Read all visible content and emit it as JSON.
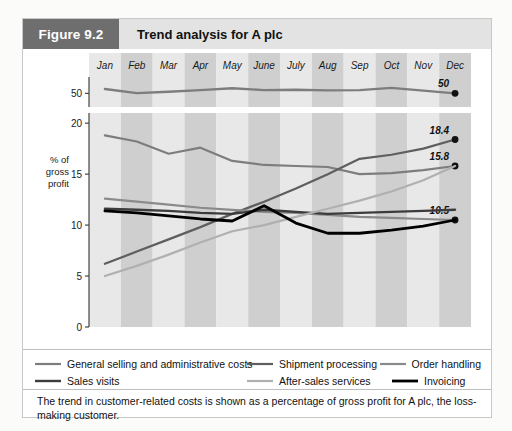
{
  "header": {
    "figure_number": "Figure 9.2",
    "title": "Trend analysis for A plc",
    "badge_color": "#6e6e6e",
    "bar_color": "#e3e3e3"
  },
  "caption": {
    "line1": "The trend in customer-related costs is shown as a percentage of gross profit for A plc,",
    "line2": "the loss-making customer."
  },
  "legend": {
    "items": [
      {
        "label": "General selling and administrative costs",
        "color": "#7d7d7d",
        "width": 2.2
      },
      {
        "label": "Shipment processing",
        "color": "#5e5e5e",
        "width": 2.2
      },
      {
        "label": "Order handling",
        "color": "#8a8a8a",
        "width": 2.2
      },
      {
        "label": "Sales visits",
        "color": "#3c3c3c",
        "width": 2.4
      },
      {
        "label": "After-sales services",
        "color": "#b0b0b0",
        "width": 2.2
      },
      {
        "label": "Invoicing",
        "color": "#000000",
        "width": 2.8
      }
    ]
  },
  "chart_data": {
    "type": "line",
    "title": "Trend analysis for A plc",
    "xlabel": "",
    "ylabel": "% of gross profit",
    "ylabel_lines": [
      "% of",
      "gross",
      "profit"
    ],
    "categories": [
      "Jan",
      "Feb",
      "Mar",
      "Apr",
      "May",
      "June",
      "July",
      "Aug",
      "Sep",
      "Oct",
      "Nov",
      "Dec"
    ],
    "grid": false,
    "legend_position": "bottom",
    "band_colors": {
      "light": "#e8e8e8",
      "dark": "#cfcfcf"
    },
    "panels": [
      {
        "name": "top-panel",
        "ylim": [
          45,
          56
        ],
        "yticks": [
          50
        ],
        "ytick_labels": [
          "50"
        ],
        "series": [
          {
            "name": "Gross margin",
            "color": "#7d7d7d",
            "width": 2.4,
            "end_label": "50",
            "marker_end": true,
            "values": [
              51.6,
              50.1,
              50.6,
              51.2,
              51.9,
              51.2,
              51.3,
              51.1,
              51.2,
              52.0,
              51.0,
              50.0
            ]
          }
        ]
      },
      {
        "name": "main-panel",
        "ylim": [
          0,
          21
        ],
        "yticks": [
          0,
          5,
          10,
          15,
          20
        ],
        "ytick_labels": [
          "0",
          "5",
          "10",
          "15",
          "20"
        ],
        "series": [
          {
            "name": "General selling and administrative costs",
            "color": "#7d7d7d",
            "width": 2.2,
            "end_label": "15.8",
            "marker_end": true,
            "values": [
              18.8,
              18.2,
              17.0,
              17.6,
              16.3,
              15.9,
              15.8,
              15.7,
              15.0,
              15.1,
              15.4,
              15.8
            ]
          },
          {
            "name": "Shipment processing",
            "color": "#5e5e5e",
            "width": 2.2,
            "end_label": "18.4",
            "marker_end": true,
            "values": [
              6.2,
              7.4,
              8.6,
              9.8,
              11.1,
              12.3,
              13.6,
              15.0,
              16.5,
              16.9,
              17.5,
              18.4
            ]
          },
          {
            "name": "Order handling",
            "color": "#8a8a8a",
            "width": 2.2,
            "end_label": "10.5",
            "marker_end": true,
            "values": [
              12.6,
              12.3,
              12.0,
              11.7,
              11.5,
              11.3,
              11.2,
              11.0,
              10.8,
              10.7,
              10.6,
              10.5
            ]
          },
          {
            "name": "Sales visits",
            "color": "#3c3c3c",
            "width": 2.4,
            "end_label": "",
            "marker_end": false,
            "values": [
              11.6,
              11.5,
              11.4,
              11.2,
              11.1,
              11.5,
              11.3,
              11.1,
              11.2,
              11.3,
              11.4,
              11.5
            ]
          },
          {
            "name": "After-sales services",
            "color": "#b0b0b0",
            "width": 2.2,
            "end_label": "",
            "marker_end": false,
            "values": [
              5.0,
              6.0,
              7.1,
              8.3,
              9.4,
              10.0,
              10.8,
              11.6,
              12.4,
              13.3,
              14.4,
              15.8
            ]
          },
          {
            "name": "Invoicing",
            "color": "#000000",
            "width": 2.8,
            "end_label": "",
            "marker_end": false,
            "values": [
              11.4,
              11.2,
              10.9,
              10.6,
              10.4,
              11.9,
              10.2,
              9.2,
              9.2,
              9.5,
              9.9,
              10.5
            ]
          }
        ]
      }
    ]
  }
}
